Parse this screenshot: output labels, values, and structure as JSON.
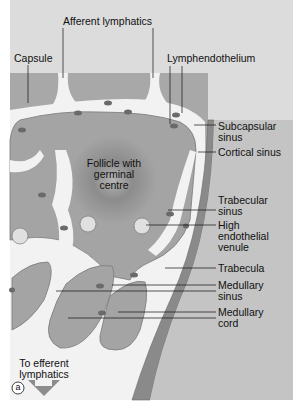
{
  "figure": {
    "panel_letter": "a",
    "colors": {
      "background": "#dcdcdc",
      "capsule": "#a8a8a8",
      "tissue": "#a4a4a4",
      "sinus": "#f2f2f2",
      "follicle_center": "#6e6e6e",
      "trabecula": "#8a8a8a",
      "cell": "#6a6a6a"
    },
    "labels": {
      "afferent_lymphatics": "Afferent lymphatics",
      "capsule": "Capsule",
      "lymphendothelium": "Lymphendothelium",
      "subcapsular_sinus": "Subcapsular\nsinus",
      "cortical_sinus": "Cortical sinus",
      "follicle": "Follicle with\ngerminal\ncentre",
      "trabecular_sinus": "Trabecular\nsinus",
      "high_endothelial_venule": "High\nendothelial\nvenule",
      "trabecula": "Trabecula",
      "medullary_sinus": "Medullary\nsinus",
      "medullary_cord": "Medullary\ncord",
      "to_efferent": "To efferent\nlymphatics"
    }
  }
}
